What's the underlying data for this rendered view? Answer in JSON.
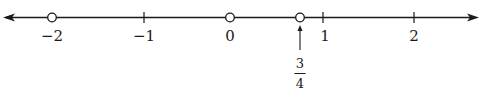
{
  "number_line": {
    "axis_color": "#1a1a1a",
    "arrows": [
      "left",
      "right"
    ],
    "ticks": [
      {
        "value": -2,
        "label": "−2"
      },
      {
        "value": -1,
        "label": "−1"
      },
      {
        "value": 0,
        "label": "0"
      },
      {
        "value": 1,
        "label": "1"
      },
      {
        "value": 2,
        "label": "2"
      }
    ],
    "open_circles": [
      -2,
      0,
      0.75
    ],
    "annotation": {
      "value": 0.75,
      "numerator": "3",
      "denominator": "4",
      "pointer": "up-arrow"
    }
  }
}
